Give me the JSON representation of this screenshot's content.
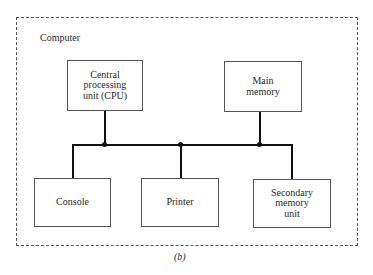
{
  "figure": {
    "container_label": "Computer",
    "caption": "(b)",
    "components": {
      "cpu": "Central\nprocessing\nunit (CPU)",
      "main_memory": "Main\nmemory",
      "console": "Console",
      "printer": "Printer",
      "secondary_memory": "Secondary\nmemory\nunit"
    },
    "connections": [
      {
        "from": "cpu",
        "to": "bus"
      },
      {
        "from": "main_memory",
        "to": "bus"
      },
      {
        "from": "console",
        "to": "bus"
      },
      {
        "from": "printer",
        "to": "bus"
      },
      {
        "from": "secondary_memory",
        "to": "bus"
      }
    ]
  }
}
